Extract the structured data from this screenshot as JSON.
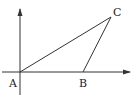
{
  "diagram": {
    "type": "geometry-triangle-on-axes",
    "colors": {
      "stroke": "#333333",
      "background": "#ffffff"
    },
    "axes": {
      "origin": [
        20,
        72
      ],
      "x_axis": {
        "from": [
          2,
          72
        ],
        "to": [
          131,
          72
        ],
        "arrow": true
      },
      "y_axis": {
        "from": [
          20,
          95
        ],
        "to": [
          20,
          8
        ],
        "arrow": true
      }
    },
    "points": [
      {
        "name": "A",
        "label": "A",
        "x": 20,
        "y": 72,
        "label_x": 9,
        "label_y": 87
      },
      {
        "name": "B",
        "label": "B",
        "x": 83,
        "y": 72,
        "label_x": 79,
        "label_y": 87
      },
      {
        "name": "C",
        "label": "C",
        "x": 111,
        "y": 17,
        "label_x": 113,
        "label_y": 16
      }
    ],
    "segments": [
      {
        "from": "A",
        "to": "C"
      },
      {
        "from": "B",
        "to": "C"
      },
      {
        "from": "A",
        "to": "B"
      }
    ]
  }
}
